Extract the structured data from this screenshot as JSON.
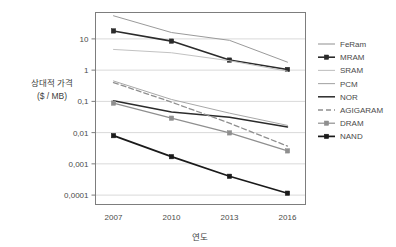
{
  "chart_data": {
    "type": "line",
    "title": "",
    "xlabel": "연도",
    "ylabel_line1": "상대적 가격",
    "ylabel_line2": "($ / MB)",
    "x": [
      2007,
      2010,
      2013,
      2016
    ],
    "categories": [
      "2007",
      "2010",
      "2013",
      "2016"
    ],
    "y_tick_labels": [
      "10",
      "1",
      "0,1",
      "0,01",
      "0,001",
      "0,0001"
    ],
    "y_tick_values": [
      10,
      1,
      0.1,
      0.01,
      0.001,
      0.0001
    ],
    "ylim": [
      5e-05,
      70
    ],
    "yscale": "log",
    "grid": true,
    "legend_position": "right",
    "series": [
      {
        "name": "FeRam",
        "values": [
          55,
          16,
          9,
          1.8
        ],
        "color": "#9a9a9a",
        "style": "solid",
        "width": 1,
        "marker": "none"
      },
      {
        "name": "MRAM",
        "values": [
          18,
          8.5,
          2.1,
          1.05
        ],
        "color": "#2b2b2b",
        "style": "solid",
        "width": 1.6,
        "marker": "square"
      },
      {
        "name": "SRAM",
        "values": [
          4.6,
          3.6,
          2.0,
          0.92
        ],
        "color": "#c2c2c2",
        "style": "solid",
        "width": 1,
        "marker": "none"
      },
      {
        "name": "PCM",
        "values": [
          0.45,
          0.115,
          0.042,
          0.017
        ],
        "color": "#a8a8a8",
        "style": "solid",
        "width": 1,
        "marker": "none"
      },
      {
        "name": "NOR",
        "values": [
          0.105,
          0.046,
          0.031,
          0.0152
        ],
        "color": "#2b2b2b",
        "style": "solid",
        "width": 1.5,
        "marker": "none"
      },
      {
        "name": "AGIGARAM",
        "values": [
          0.4,
          0.095,
          0.02,
          0.0037
        ],
        "color": "#8f8f8f",
        "style": "dashed",
        "width": 1.3,
        "marker": "none"
      },
      {
        "name": "DRAM",
        "values": [
          0.088,
          0.029,
          0.0098,
          0.0026
        ],
        "color": "#8f8f8f",
        "style": "solid",
        "width": 1.2,
        "marker": "square"
      },
      {
        "name": "NAND",
        "values": [
          0.008,
          0.0017,
          0.0004,
          0.000115
        ],
        "color": "#1a1a1a",
        "style": "solid",
        "width": 1.7,
        "marker": "square"
      }
    ]
  },
  "legend": {
    "items": [
      {
        "label": "FeRam"
      },
      {
        "label": "MRAM"
      },
      {
        "label": "SRAM"
      },
      {
        "label": "PCM"
      },
      {
        "label": "NOR"
      },
      {
        "label": "AGIGARAM"
      },
      {
        "label": "DRAM"
      },
      {
        "label": "NAND"
      }
    ]
  }
}
